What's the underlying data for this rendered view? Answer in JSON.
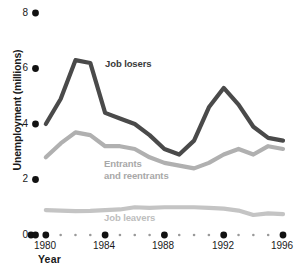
{
  "chart_data": {
    "type": "line",
    "title": "",
    "xlabel": "Year",
    "ylabel": "Unemployment (millions)",
    "xlim": [
      1979,
      1996
    ],
    "ylim": [
      0,
      8
    ],
    "yticks": [
      0,
      2,
      4,
      6,
      8
    ],
    "ytick_labels": [
      "0",
      "2",
      "4",
      "6",
      "8"
    ],
    "xticks": [
      1980,
      1984,
      1988,
      1992,
      1996
    ],
    "xtick_labels": [
      "1980",
      "1984",
      "1988",
      "1992",
      "1996"
    ],
    "minor_xticks": [
      1981,
      1982,
      1983,
      1985,
      1986,
      1987,
      1989,
      1990,
      1991,
      1993,
      1994,
      1995
    ],
    "grid": false,
    "legend_position": "inline-annotations",
    "x": [
      1980,
      1981,
      1982,
      1983,
      1984,
      1985,
      1986,
      1987,
      1988,
      1989,
      1990,
      1991,
      1992,
      1993,
      1994,
      1995,
      1996
    ],
    "series": [
      {
        "name": "Job losers",
        "color": "#4a4a4a",
        "values": [
          4.0,
          4.9,
          6.3,
          6.2,
          4.4,
          4.2,
          4.0,
          3.6,
          3.1,
          2.9,
          3.4,
          4.6,
          5.3,
          4.7,
          3.9,
          3.5,
          3.4
        ]
      },
      {
        "name": "Entrants\nand reentrants",
        "color": "#b0b0b0",
        "values": [
          2.8,
          3.3,
          3.7,
          3.6,
          3.2,
          3.2,
          3.1,
          2.8,
          2.6,
          2.5,
          2.4,
          2.6,
          2.9,
          3.1,
          2.9,
          3.2,
          3.1
        ]
      },
      {
        "name": "Job leavers",
        "color": "#c4c4c4",
        "values": [
          0.9,
          0.88,
          0.86,
          0.87,
          0.9,
          0.92,
          1.0,
          0.98,
          1.0,
          1.0,
          1.0,
          0.98,
          0.95,
          0.88,
          0.72,
          0.78,
          0.75
        ]
      }
    ]
  },
  "axes": {
    "y_title": "Unemployment (millions)",
    "x_title": "Year"
  }
}
